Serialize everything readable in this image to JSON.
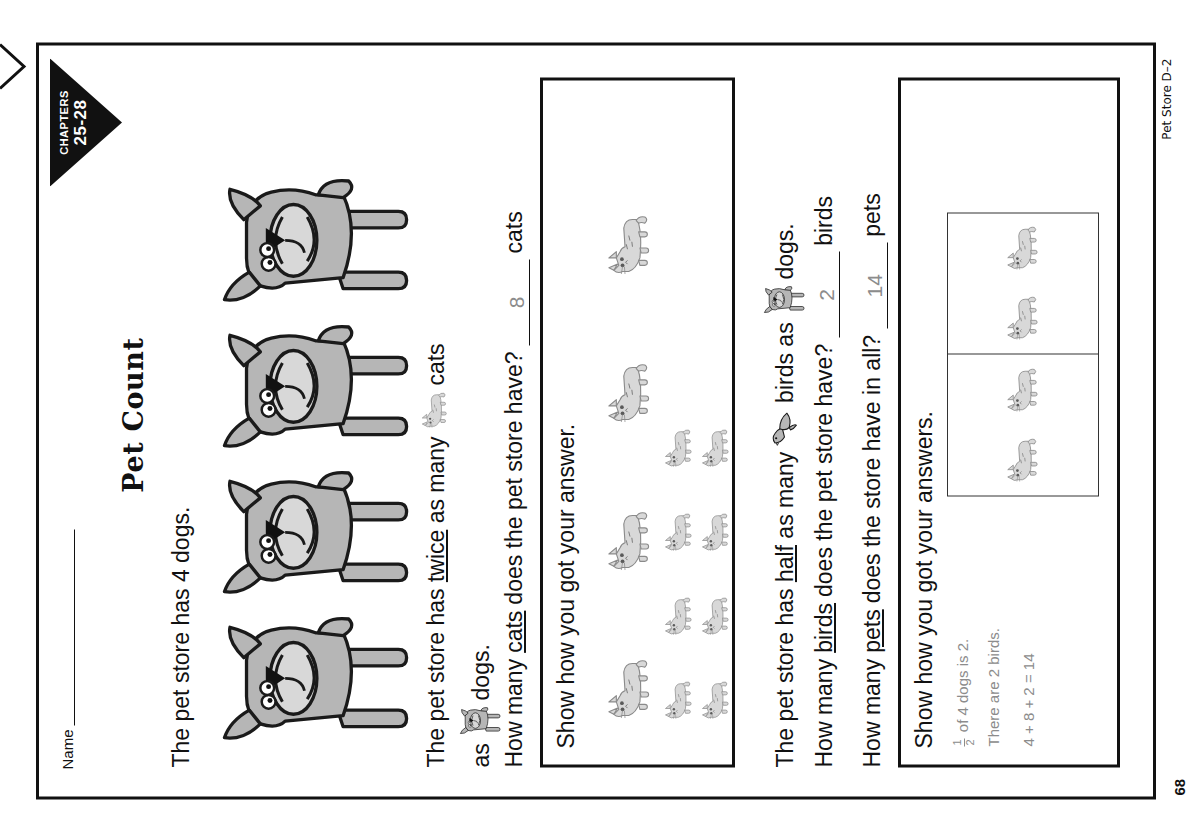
{
  "page": {
    "name_label": "Name",
    "chapter_badge": {
      "line1": "CHAPTERS",
      "line2": "25-28"
    },
    "title": "Pet Count",
    "footer_code": "Pet Store D–2",
    "page_number": "68"
  },
  "problems": {
    "intro": "The pet store has 4 dogs.",
    "dogs_shown": 4,
    "statement_cats": {
      "part1": "The pet store has ",
      "twice": "twice",
      "part2": " as many",
      "cat_icon": "cat-icon",
      "part3": " cats",
      "part4": "as",
      "dog_icon": "dog-icon",
      "part5": " dogs."
    },
    "question_cats": {
      "lead": "How many ",
      "keyword": "cats",
      "tail": " does the pet store have?",
      "answer": "8",
      "unit": "cats"
    },
    "work_cats": {
      "prompt": "Show how you got your answer.",
      "row1_count": 4,
      "row2_count": 8
    },
    "statement_birds": {
      "part1": "The pet store has ",
      "half": "half",
      "part2": " as many",
      "bird_icon": "bird-icon",
      "part3": " birds as",
      "dog_icon": "dog-icon",
      "part4": " dogs."
    },
    "question_birds": {
      "lead": "How many ",
      "keyword": "birds",
      "tail": " does the pet store have?",
      "answer": "2",
      "unit": "birds"
    },
    "question_pets": {
      "lead": "How many ",
      "keyword": "pets",
      "tail": " does the store have in all?",
      "answer": "14",
      "unit": "pets"
    },
    "work_pets": {
      "prompt": "Show how you got your answers.",
      "frac_numerator": "1",
      "frac_denominator": "2",
      "line1_rest": " of 4 dogs is 2.",
      "line2": "There are 2 birds.",
      "line3": "4 + 8 + 2 = 14",
      "grid_cells": [
        2,
        2
      ]
    }
  },
  "colors": {
    "ink": "#111111",
    "pencil": "#8c8c8c",
    "animal_fill": "#b6b6b6",
    "animal_light": "#d8d8d8",
    "animal_stroke": "#1a1a1a"
  }
}
